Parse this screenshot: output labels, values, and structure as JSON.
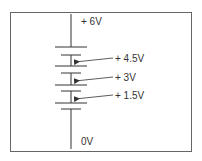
{
  "diagram": {
    "type": "battery-stack-voltage-taps",
    "colors": {
      "line": "#333333",
      "border": "#555555",
      "background": "#ffffff"
    },
    "labels": {
      "top": "+ 6V",
      "tap_4_5": "+ 4.5V",
      "tap_3": "+ 3V",
      "tap_1_5": "+ 1.5V",
      "bottom": "0V"
    },
    "cells": [
      {
        "index": 1,
        "voltage": "1.5V"
      },
      {
        "index": 2,
        "voltage": "1.5V"
      },
      {
        "index": 3,
        "voltage": "1.5V"
      },
      {
        "index": 4,
        "voltage": "1.5V"
      }
    ]
  }
}
